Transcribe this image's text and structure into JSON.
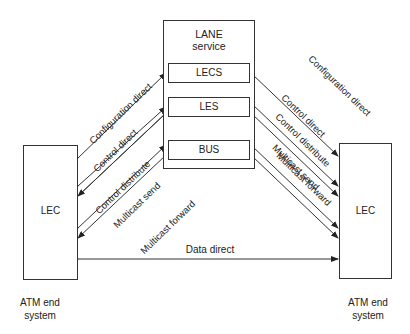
{
  "diagram": {
    "lane_service": {
      "title_line1": "LANE",
      "title_line2": "service",
      "components": [
        "LECS",
        "LES",
        "BUS"
      ]
    },
    "left_node": {
      "label": "LEC",
      "caption_line1": "ATM end",
      "caption_line2": "system"
    },
    "right_node": {
      "label": "LEC",
      "caption_line1": "ATM end",
      "caption_line2": "system"
    },
    "connections_left": [
      {
        "label": "Configuration direct",
        "from": "LEC",
        "to": "LECS",
        "bidirectional": true
      },
      {
        "label": "Control direct",
        "from": "LEC",
        "to": "LES",
        "bidirectional": true
      },
      {
        "label": "Control distribute",
        "from": "LES",
        "to": "LEC",
        "bidirectional": false
      },
      {
        "label": "Multicast send",
        "from": "LEC",
        "to": "BUS",
        "bidirectional": true
      },
      {
        "label": "Multicast forward",
        "from": "BUS",
        "to": "LEC",
        "bidirectional": false
      }
    ],
    "connections_right": [
      {
        "label": "Configuration direct",
        "from": "LEC",
        "to": "LECS",
        "bidirectional": true
      },
      {
        "label": "Control direct",
        "from": "LEC",
        "to": "LES",
        "bidirectional": true
      },
      {
        "label": "Control distribute",
        "from": "LES",
        "to": "LEC",
        "bidirectional": false
      },
      {
        "label": "Multicast send",
        "from": "LEC",
        "to": "BUS",
        "bidirectional": true
      },
      {
        "label": "Multicast forward",
        "from": "BUS",
        "to": "LEC",
        "bidirectional": false
      }
    ],
    "data_direct": {
      "label": "Data direct",
      "from": "LEC",
      "to": "LEC",
      "bidirectional": true
    }
  }
}
